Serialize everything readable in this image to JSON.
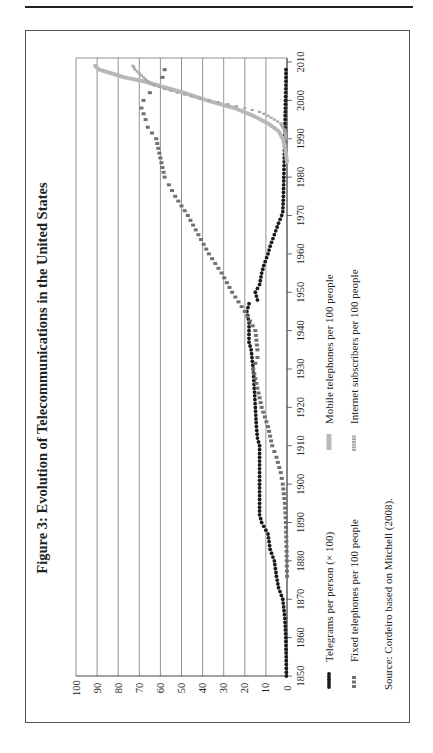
{
  "chart_data": {
    "type": "line",
    "orientation": "rotated-90-ccw",
    "title": "Figure 3: Evolution of Telecommunications in the United States",
    "xlabel": "",
    "ylabel": "",
    "x_ticks": [
      "1850",
      "1860",
      "1870",
      "1880",
      "1890",
      "1900",
      "1910",
      "1920",
      "1930",
      "1940",
      "1950",
      "1960",
      "1970",
      "1980",
      "1990",
      "2000",
      "2010"
    ],
    "y_ticks": [
      "0",
      "10",
      "20",
      "30",
      "40",
      "50",
      "60",
      "70",
      "80",
      "90",
      "100"
    ],
    "xlim": [
      1850,
      2010
    ],
    "ylim": [
      0,
      100
    ],
    "grid": "horizontal-major",
    "legend_position": "bottom",
    "series": [
      {
        "name": "Telegrams per person (× 100)",
        "style": "black-dots",
        "color": "#1a1a1a",
        "points": [
          [
            1850,
            0.3
          ],
          [
            1855,
            0.4
          ],
          [
            1860,
            0.6
          ],
          [
            1865,
            1
          ],
          [
            1870,
            2
          ],
          [
            1873,
            4
          ],
          [
            1876,
            5
          ],
          [
            1880,
            6
          ],
          [
            1883,
            8
          ],
          [
            1887,
            9
          ],
          [
            1890,
            12
          ],
          [
            1892,
            13
          ],
          [
            1895,
            13
          ],
          [
            1900,
            13
          ],
          [
            1905,
            13
          ],
          [
            1910,
            13
          ],
          [
            1912,
            14
          ],
          [
            1915,
            14.5
          ],
          [
            1920,
            15
          ],
          [
            1925,
            15.5
          ],
          [
            1930,
            16
          ],
          [
            1935,
            17
          ],
          [
            1937,
            18
          ],
          [
            1940,
            18
          ],
          [
            1942,
            18
          ],
          [
            1945,
            19
          ],
          [
            1947,
            18
          ],
          [
            1948,
            14
          ],
          [
            1950,
            15
          ],
          [
            1952,
            13
          ],
          [
            1955,
            12
          ],
          [
            1957,
            11
          ],
          [
            1960,
            9
          ],
          [
            1962,
            8
          ],
          [
            1965,
            6
          ],
          [
            1968,
            4
          ],
          [
            1970,
            2.5
          ],
          [
            1971,
            2
          ],
          [
            1975,
            1.7
          ],
          [
            1980,
            1.5
          ],
          [
            1985,
            1.3
          ],
          [
            1990,
            1.1
          ],
          [
            1993,
            1.0
          ],
          [
            1995,
            0.9
          ],
          [
            2000,
            0.7
          ],
          [
            2005,
            0.5
          ],
          [
            2008,
            0.5
          ]
        ]
      },
      {
        "name": "Fixed telephones per 100 people",
        "style": "dark-gray-squares",
        "color": "#707070",
        "points": [
          [
            1876,
            0
          ],
          [
            1880,
            0.1
          ],
          [
            1885,
            0.3
          ],
          [
            1890,
            0.5
          ],
          [
            1895,
            1
          ],
          [
            1900,
            2
          ],
          [
            1903,
            3
          ],
          [
            1907,
            5
          ],
          [
            1910,
            7
          ],
          [
            1915,
            9
          ],
          [
            1920,
            12
          ],
          [
            1925,
            14
          ],
          [
            1930,
            16
          ],
          [
            1933,
            14
          ],
          [
            1935,
            14
          ],
          [
            1940,
            15
          ],
          [
            1945,
            20
          ],
          [
            1950,
            26
          ],
          [
            1955,
            31
          ],
          [
            1960,
            37
          ],
          [
            1965,
            42
          ],
          [
            1970,
            47
          ],
          [
            1975,
            53
          ],
          [
            1978,
            56
          ],
          [
            1980,
            58
          ],
          [
            1985,
            60
          ],
          [
            1990,
            62
          ],
          [
            1993,
            66
          ],
          [
            1995,
            67
          ],
          [
            1998,
            69
          ],
          [
            2000,
            68
          ],
          [
            2002,
            65
          ],
          [
            2004,
            62
          ],
          [
            2006,
            59
          ],
          [
            2008,
            58
          ]
        ]
      },
      {
        "name": "Mobile telephones per 100 people",
        "style": "light-gray-thick",
        "color": "#b8b8b8",
        "points": [
          [
            1984,
            0
          ],
          [
            1988,
            1
          ],
          [
            1990,
            2
          ],
          [
            1992,
            4
          ],
          [
            1994,
            9
          ],
          [
            1996,
            16
          ],
          [
            1998,
            25
          ],
          [
            2000,
            38
          ],
          [
            2002,
            49
          ],
          [
            2004,
            62
          ],
          [
            2005,
            68
          ],
          [
            2006,
            77
          ],
          [
            2007,
            83
          ],
          [
            2008,
            89
          ],
          [
            2009,
            91
          ]
        ]
      },
      {
        "name": "Internet subscribers per 100 people",
        "style": "light-gray-dots",
        "color": "#a8a8a8",
        "points": [
          [
            1990,
            0.5
          ],
          [
            1992,
            1
          ],
          [
            1994,
            3
          ],
          [
            1996,
            9
          ],
          [
            1997,
            13
          ],
          [
            1998,
            20
          ],
          [
            1999,
            28
          ],
          [
            2000,
            37
          ],
          [
            2001,
            45
          ],
          [
            2002,
            52
          ],
          [
            2003,
            58
          ],
          [
            2004,
            63
          ],
          [
            2005,
            66
          ],
          [
            2006,
            68
          ],
          [
            2007,
            70
          ],
          [
            2008,
            72
          ],
          [
            2009,
            73
          ]
        ]
      }
    ]
  },
  "source_note": "Source: Cordeiro based on Mitchell (2008)."
}
